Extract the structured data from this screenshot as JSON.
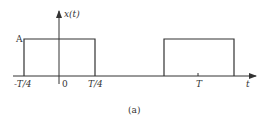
{
  "figure": {
    "caption": "(a)",
    "y_axis_label": "x(t)",
    "x_axis_label": "t",
    "amplitude_label": "A",
    "tick_labels": {
      "neg_quarter": "-T/4",
      "zero": "0",
      "pos_quarter": "T/4",
      "period": "T"
    },
    "line_color": "#333333",
    "pulses": [
      {
        "start": "-T/4",
        "end": "T/4",
        "height": "A"
      },
      {
        "start": "3T/4",
        "end": "5T/4",
        "height": "A"
      }
    ]
  }
}
